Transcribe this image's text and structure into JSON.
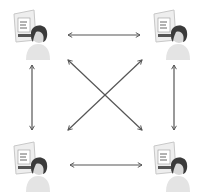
{
  "diagram": {
    "type": "fully-connected-network",
    "nodes": [
      {
        "id": "user-top-left",
        "label": "User 1",
        "icon": "person-with-document-icon"
      },
      {
        "id": "user-top-right",
        "label": "User 2",
        "icon": "person-with-document-icon"
      },
      {
        "id": "user-bottom-left",
        "label": "User 3",
        "icon": "person-with-document-icon"
      },
      {
        "id": "user-bottom-right",
        "label": "User 4",
        "icon": "person-with-document-icon"
      }
    ],
    "edges": [
      {
        "from": "user-top-left",
        "to": "user-top-right",
        "style": "bidirectional-arrow"
      },
      {
        "from": "user-bottom-left",
        "to": "user-bottom-right",
        "style": "bidirectional-arrow"
      },
      {
        "from": "user-top-left",
        "to": "user-bottom-left",
        "style": "bidirectional-arrow"
      },
      {
        "from": "user-top-right",
        "to": "user-bottom-right",
        "style": "bidirectional-arrow"
      },
      {
        "from": "user-top-left",
        "to": "user-bottom-right",
        "style": "bidirectional-arrow"
      },
      {
        "from": "user-top-right",
        "to": "user-bottom-left",
        "style": "bidirectional-arrow"
      }
    ],
    "colors": {
      "arrow": "#555555",
      "panel_frame": "#c8c8c8",
      "panel_fill": "#eeeeee",
      "panel_bar": "#555555",
      "hair": "#3a3a3a",
      "skin": "#d8d8d8",
      "body": "#e4e4e4"
    }
  }
}
